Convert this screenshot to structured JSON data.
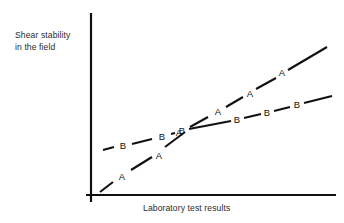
{
  "chart_data": {
    "type": "line",
    "title": "",
    "xlabel": "Laboratory test results",
    "ylabel": "Shear stability\nin the field",
    "grid": false,
    "legend": "inline-point-labels",
    "axes": {
      "x_axis_shown": true,
      "y_axis_shown": true,
      "tick_labels_x": [],
      "tick_labels_y": [],
      "xlim": [
        0,
        100
      ],
      "ylim": [
        0,
        100
      ]
    },
    "annotation": "Two dashed trend lines labelled A and B cross near the middle of the plot; line A is steeper and ends higher than line B.",
    "series": [
      {
        "name": "A",
        "marker_label": "A",
        "style": "dashed-with-letter-labels",
        "points": [
          {
            "label": "A",
            "x": 4.2,
            "y": 5.0
          },
          {
            "label": "A",
            "x": 28.5,
            "y": 24.1
          },
          {
            "label": "A",
            "x": 36.0,
            "y": 36.5
          },
          {
            "label": "A",
            "x": 52.5,
            "y": 53.0
          },
          {
            "label": "A",
            "x": 65.0,
            "y": 63.5
          },
          {
            "label": "A",
            "x": 84.0,
            "y": 79.0
          }
        ]
      },
      {
        "name": "B",
        "marker_label": "B",
        "style": "dashed-with-letter-labels",
        "points": [
          {
            "label": "B",
            "x": 13.5,
            "y": 29.0
          },
          {
            "label": "B",
            "x": 29.5,
            "y": 34.5
          },
          {
            "label": "B",
            "x": 44.0,
            "y": 38.5
          },
          {
            "label": "B",
            "x": 60.5,
            "y": 43.0
          },
          {
            "label": "B",
            "x": 73.0,
            "y": 47.0
          },
          {
            "label": "B",
            "x": 85.5,
            "y": 50.5
          }
        ]
      }
    ],
    "line_a_segments": [
      {
        "x1": 100,
        "y1": 192,
        "x2": 113,
        "y2": 182
      },
      {
        "x1": 131,
        "y1": 170,
        "x2": 152,
        "y2": 157
      },
      {
        "x1": 165,
        "y1": 147,
        "x2": 185,
        "y2": 132
      },
      {
        "x1": 190,
        "y1": 127,
        "x2": 208,
        "y2": 117
      },
      {
        "x1": 226,
        "y1": 107,
        "x2": 243,
        "y2": 97
      },
      {
        "x1": 256,
        "y1": 89,
        "x2": 276,
        "y2": 78
      },
      {
        "x1": 288,
        "y1": 70,
        "x2": 327,
        "y2": 47
      }
    ],
    "line_b_segments": [
      {
        "x1": 103,
        "y1": 150,
        "x2": 114,
        "y2": 147
      },
      {
        "x1": 132,
        "y1": 144,
        "x2": 152,
        "y2": 139
      },
      {
        "x1": 171,
        "y1": 134,
        "x2": 175,
        "y2": 133
      },
      {
        "x1": 189,
        "y1": 129,
        "x2": 231,
        "y2": 121
      },
      {
        "x1": 244,
        "y1": 118,
        "x2": 261,
        "y2": 114
      },
      {
        "x1": 274,
        "y1": 111,
        "x2": 290,
        "y2": 107
      },
      {
        "x1": 304,
        "y1": 103,
        "x2": 332,
        "y2": 96
      }
    ],
    "line_a_labels": [
      {
        "text": "A",
        "x": 122,
        "y": 177
      },
      {
        "text": "A",
        "x": 159,
        "y": 156
      },
      {
        "text": "A",
        "x": 179,
        "y": 133
      },
      {
        "text": "A",
        "x": 218,
        "y": 112
      },
      {
        "text": "A",
        "x": 250,
        "y": 94
      },
      {
        "text": "A",
        "x": 282,
        "y": 73
      }
    ],
    "line_b_labels": [
      {
        "text": "B",
        "x": 123,
        "y": 146
      },
      {
        "text": "B",
        "x": 162,
        "y": 137
      },
      {
        "text": "B",
        "x": 182,
        "y": 131
      },
      {
        "text": "B",
        "x": 237,
        "y": 120
      },
      {
        "text": "B",
        "x": 267,
        "y": 113
      },
      {
        "text": "B",
        "x": 297,
        "y": 105
      }
    ],
    "colors": {
      "line": "#111111",
      "axis": "#111111",
      "text": "#2b2b2b",
      "background": "#ffffff"
    }
  },
  "axis_labels": {
    "y_line1": "Shear stability",
    "y_line2": "in the field",
    "x": "Laboratory test results"
  }
}
